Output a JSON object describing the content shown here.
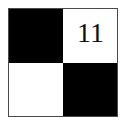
{
  "figure": {
    "type": "checkerboard-square",
    "border_color": "#4a4a4a",
    "background_color": "#ffffff",
    "black_color": "#000000",
    "white_color": "#ffffff",
    "cells": [
      {
        "position": "top-left",
        "fill": "black",
        "label": ""
      },
      {
        "position": "top-right",
        "fill": "white",
        "label": "11"
      },
      {
        "position": "bottom-left",
        "fill": "white",
        "label": ""
      },
      {
        "position": "bottom-right",
        "fill": "black",
        "label": ""
      }
    ]
  }
}
